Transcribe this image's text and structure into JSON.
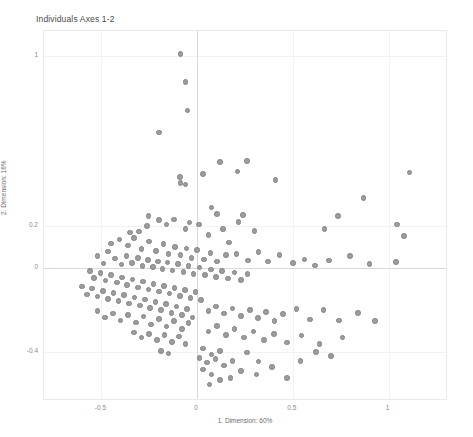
{
  "chart_data": {
    "type": "scatter",
    "title": "Individuals Axes 1-2",
    "xlabel": "1. Dimension: 60%",
    "ylabel": "2. Dimension: 16%",
    "grid": true,
    "legend": null,
    "xlim": [
      -0.8,
      1.3
    ],
    "ylim": [
      -0.62,
      1.12
    ],
    "xticks": [
      -0.5,
      0,
      0.5,
      1
    ],
    "xticklabels": [
      "-0.5",
      "0",
      "0.5",
      "1"
    ],
    "yticks": [
      -0.4,
      0,
      0.2,
      1
    ],
    "yticklabels": [
      "-0.4",
      "0",
      "0.2",
      "1"
    ],
    "reference_lines": {
      "x": 0,
      "y": 0
    },
    "point_color": "#9d9d9d",
    "point_edge_color": "#828282",
    "points": [
      [
        -0.086,
        1.01
      ],
      [
        -0.06,
        0.88
      ],
      [
        -0.05,
        0.745
      ],
      [
        -0.2,
        0.64
      ],
      [
        -0.09,
        0.43
      ],
      [
        -0.088,
        0.4
      ],
      [
        -0.06,
        0.395
      ],
      [
        0.03,
        0.445
      ],
      [
        0.12,
        0.5
      ],
      [
        0.21,
        0.455
      ],
      [
        0.26,
        0.505
      ],
      [
        0.41,
        0.415
      ],
      [
        0.87,
        0.33
      ],
      [
        1.11,
        0.45
      ],
      [
        -0.255,
        0.245
      ],
      [
        -0.2,
        0.225
      ],
      [
        -0.262,
        0.198
      ],
      [
        -0.305,
        0.172
      ],
      [
        -0.35,
        0.168
      ],
      [
        -0.16,
        0.205
      ],
      [
        -0.12,
        0.228
      ],
      [
        -0.06,
        0.185
      ],
      [
        -0.04,
        0.215
      ],
      [
        0.01,
        0.205
      ],
      [
        0.075,
        0.285
      ],
      [
        0.105,
        0.255
      ],
      [
        0.135,
        0.185
      ],
      [
        0.215,
        0.218
      ],
      [
        0.3,
        0.175
      ],
      [
        0.06,
        0.155
      ],
      [
        0.165,
        0.12
      ],
      [
        0.24,
        0.25
      ],
      [
        0.665,
        0.185
      ],
      [
        0.735,
        0.245
      ],
      [
        1.045,
        0.205
      ],
      [
        1.08,
        0.15
      ],
      [
        -0.45,
        0.115
      ],
      [
        -0.405,
        0.135
      ],
      [
        -0.36,
        0.105
      ],
      [
        -0.33,
        0.14
      ],
      [
        -0.29,
        0.09
      ],
      [
        -0.25,
        0.125
      ],
      [
        -0.215,
        0.08
      ],
      [
        -0.175,
        0.112
      ],
      [
        -0.15,
        0.065
      ],
      [
        -0.115,
        0.098
      ],
      [
        -0.088,
        0.06
      ],
      [
        -0.055,
        0.092
      ],
      [
        -0.03,
        0.048
      ],
      [
        0.0,
        0.085
      ],
      [
        0.035,
        0.04
      ],
      [
        0.07,
        0.07
      ],
      [
        0.105,
        0.03
      ],
      [
        0.15,
        0.06
      ],
      [
        0.205,
        0.065
      ],
      [
        0.265,
        0.035
      ],
      [
        0.32,
        0.075
      ],
      [
        0.37,
        0.03
      ],
      [
        0.43,
        0.06
      ],
      [
        0.5,
        0.022
      ],
      [
        0.56,
        0.04
      ],
      [
        0.615,
        0.012
      ],
      [
        0.69,
        0.035
      ],
      [
        0.8,
        0.055
      ],
      [
        0.9,
        0.018
      ],
      [
        1.04,
        0.028
      ],
      [
        -0.52,
        0.055
      ],
      [
        -0.49,
        0.02
      ],
      [
        -0.465,
        0.078
      ],
      [
        -0.43,
        0.045
      ],
      [
        -0.395,
        0.015
      ],
      [
        -0.37,
        0.055
      ],
      [
        -0.34,
        0.022
      ],
      [
        -0.31,
        0.048
      ],
      [
        -0.285,
        0.01
      ],
      [
        -0.258,
        0.038
      ],
      [
        -0.23,
        0.005
      ],
      [
        -0.205,
        0.03
      ],
      [
        -0.18,
        -0.005
      ],
      [
        -0.155,
        0.025
      ],
      [
        -0.128,
        -0.012
      ],
      [
        -0.1,
        0.018
      ],
      [
        -0.072,
        -0.02
      ],
      [
        -0.045,
        0.01
      ],
      [
        -0.018,
        -0.028
      ],
      [
        0.012,
        0.002
      ],
      [
        0.042,
        -0.035
      ],
      [
        0.072,
        -0.008
      ],
      [
        0.1,
        -0.042
      ],
      [
        0.13,
        -0.015
      ],
      [
        0.162,
        -0.05
      ],
      [
        0.195,
        -0.022
      ],
      [
        0.228,
        -0.058
      ],
      [
        0.262,
        -0.03
      ],
      [
        -0.56,
        -0.015
      ],
      [
        -0.54,
        -0.048
      ],
      [
        -0.505,
        -0.025
      ],
      [
        -0.478,
        -0.06
      ],
      [
        -0.45,
        -0.035
      ],
      [
        -0.42,
        -0.07
      ],
      [
        -0.392,
        -0.045
      ],
      [
        -0.365,
        -0.082
      ],
      [
        -0.338,
        -0.055
      ],
      [
        -0.31,
        -0.092
      ],
      [
        -0.282,
        -0.065
      ],
      [
        -0.255,
        -0.102
      ],
      [
        -0.228,
        -0.075
      ],
      [
        -0.2,
        -0.112
      ],
      [
        -0.172,
        -0.085
      ],
      [
        -0.145,
        -0.122
      ],
      [
        -0.118,
        -0.095
      ],
      [
        -0.09,
        -0.132
      ],
      [
        -0.062,
        -0.105
      ],
      [
        -0.035,
        -0.142
      ],
      [
        -0.008,
        -0.115
      ],
      [
        0.02,
        -0.152
      ],
      [
        -0.6,
        -0.088
      ],
      [
        -0.575,
        -0.125
      ],
      [
        -0.548,
        -0.098
      ],
      [
        -0.52,
        -0.135
      ],
      [
        -0.492,
        -0.108
      ],
      [
        -0.465,
        -0.148
      ],
      [
        -0.438,
        -0.118
      ],
      [
        -0.41,
        -0.158
      ],
      [
        -0.382,
        -0.128
      ],
      [
        -0.355,
        -0.168
      ],
      [
        -0.328,
        -0.14
      ],
      [
        -0.3,
        -0.178
      ],
      [
        -0.272,
        -0.15
      ],
      [
        -0.245,
        -0.19
      ],
      [
        -0.218,
        -0.16
      ],
      [
        -0.19,
        -0.2
      ],
      [
        -0.162,
        -0.172
      ],
      [
        -0.135,
        -0.212
      ],
      [
        -0.108,
        -0.182
      ],
      [
        -0.08,
        -0.222
      ],
      [
        -0.052,
        -0.195
      ],
      [
        -0.025,
        -0.235
      ],
      [
        -0.52,
        -0.205
      ],
      [
        -0.48,
        -0.235
      ],
      [
        -0.44,
        -0.215
      ],
      [
        -0.4,
        -0.248
      ],
      [
        -0.36,
        -0.222
      ],
      [
        -0.32,
        -0.258
      ],
      [
        -0.28,
        -0.23
      ],
      [
        -0.24,
        -0.268
      ],
      [
        -0.2,
        -0.242
      ],
      [
        -0.16,
        -0.278
      ],
      [
        -0.12,
        -0.252
      ],
      [
        -0.08,
        -0.288
      ],
      [
        -0.045,
        -0.262
      ],
      [
        -0.33,
        -0.305
      ],
      [
        -0.29,
        -0.33
      ],
      [
        -0.25,
        -0.312
      ],
      [
        -0.21,
        -0.342
      ],
      [
        -0.17,
        -0.318
      ],
      [
        -0.13,
        -0.35
      ],
      [
        -0.095,
        -0.325
      ],
      [
        -0.06,
        -0.36
      ],
      [
        -0.19,
        -0.392
      ],
      [
        -0.15,
        -0.405
      ],
      [
        0.06,
        -0.205
      ],
      [
        0.1,
        -0.182
      ],
      [
        0.14,
        -0.215
      ],
      [
        0.185,
        -0.192
      ],
      [
        0.23,
        -0.228
      ],
      [
        0.275,
        -0.2
      ],
      [
        0.318,
        -0.238
      ],
      [
        0.36,
        -0.21
      ],
      [
        0.405,
        -0.25
      ],
      [
        0.45,
        -0.218
      ],
      [
        0.52,
        -0.195
      ],
      [
        0.59,
        -0.245
      ],
      [
        0.66,
        -0.2
      ],
      [
        0.74,
        -0.248
      ],
      [
        0.84,
        -0.212
      ],
      [
        0.93,
        -0.25
      ],
      [
        0.06,
        -0.3
      ],
      [
        0.105,
        -0.275
      ],
      [
        0.15,
        -0.318
      ],
      [
        0.195,
        -0.29
      ],
      [
        0.245,
        -0.33
      ],
      [
        0.295,
        -0.3
      ],
      [
        0.35,
        -0.342
      ],
      [
        0.4,
        -0.312
      ],
      [
        0.47,
        -0.352
      ],
      [
        0.545,
        -0.32
      ],
      [
        0.64,
        -0.36
      ],
      [
        0.76,
        -0.33
      ],
      [
        0.03,
        -0.382
      ],
      [
        0.075,
        -0.41
      ],
      [
        0.12,
        -0.392
      ],
      [
        0.012,
        -0.425
      ],
      [
        0.05,
        -0.448
      ],
      [
        0.095,
        -0.432
      ],
      [
        0.14,
        -0.462
      ],
      [
        0.185,
        -0.44
      ],
      [
        0.03,
        -0.48
      ],
      [
        0.075,
        -0.505
      ],
      [
        0.12,
        -0.53
      ],
      [
        0.065,
        -0.552
      ],
      [
        0.26,
        -0.4
      ],
      [
        0.32,
        -0.442
      ],
      [
        0.39,
        -0.47
      ],
      [
        0.47,
        -0.52
      ],
      [
        0.31,
        -0.505
      ],
      [
        0.23,
        -0.488
      ],
      [
        0.175,
        -0.522
      ],
      [
        0.54,
        -0.44
      ],
      [
        0.62,
        -0.398
      ],
      [
        0.7,
        -0.418
      ]
    ]
  }
}
